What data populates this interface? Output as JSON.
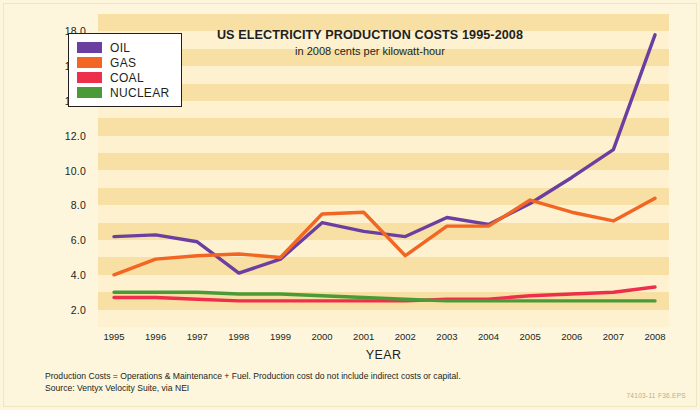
{
  "chart_data": {
    "type": "line",
    "title": "US ELECTRICITY PRODUCTION COSTS 1995-2008",
    "subtitle": "in 2008 cents per kilowatt-hour",
    "xlabel": "YEAR",
    "ylabel": "",
    "x": [
      1995,
      1996,
      1997,
      1998,
      1999,
      2000,
      2001,
      2002,
      2003,
      2004,
      2005,
      2006,
      2007,
      2008
    ],
    "categories": [
      "1995",
      "1996",
      "1997",
      "1998",
      "1999",
      "2000",
      "2001",
      "2002",
      "2003",
      "2004",
      "2005",
      "2006",
      "2007",
      "2008"
    ],
    "ylim": [
      1.0,
      19.0
    ],
    "yticks": [
      "2.0",
      "4.0",
      "6.0",
      "8.0",
      "10.0",
      "12.0",
      "14.0",
      "16.0",
      "18.0"
    ],
    "ytick_values": [
      2.0,
      4.0,
      6.0,
      8.0,
      10.0,
      12.0,
      14.0,
      16.0,
      18.0
    ],
    "grid": "horizontal-bands",
    "legend_position": "top-left",
    "series": [
      {
        "name": "OIL",
        "color": "#6B3FA0",
        "values": [
          6.2,
          6.3,
          5.9,
          4.1,
          4.9,
          7.0,
          6.5,
          6.2,
          7.3,
          6.9,
          8.1,
          9.6,
          11.2,
          17.8
        ]
      },
      {
        "name": "GAS",
        "color": "#F26522",
        "values": [
          4.0,
          4.9,
          5.1,
          5.2,
          5.0,
          7.5,
          7.6,
          5.1,
          6.8,
          6.8,
          8.3,
          7.6,
          7.1,
          8.4
        ]
      },
      {
        "name": "COAL",
        "color": "#ED2F4C",
        "values": [
          2.7,
          2.7,
          2.6,
          2.5,
          2.5,
          2.5,
          2.5,
          2.5,
          2.6,
          2.6,
          2.8,
          2.9,
          3.0,
          3.3
        ]
      },
      {
        "name": "NUCLEAR",
        "color": "#4A9B38",
        "values": [
          3.0,
          3.0,
          3.0,
          2.9,
          2.9,
          2.8,
          2.7,
          2.6,
          2.5,
          2.5,
          2.5,
          2.5,
          2.5,
          2.5
        ]
      }
    ]
  },
  "legend": {
    "items": [
      {
        "label": "OIL",
        "color": "#6B3FA0"
      },
      {
        "label": "GAS",
        "color": "#F26522"
      },
      {
        "label": "COAL",
        "color": "#ED2F4C"
      },
      {
        "label": "NUCLEAR",
        "color": "#4A9B38"
      }
    ]
  },
  "footnotes": [
    "Production Costs = Operations & Maintenance + Fuel. Production cost do not include indirect costs or capital.",
    "Source: Ventyx Velocity Suite, via NEI"
  ],
  "doc_code": "74103-11  F36.EPS",
  "colors": {
    "page_background": "#fffdf2",
    "figure_background": "#fdf6dd",
    "plot_background": "#fdf1cf",
    "band": "#f8e0a4",
    "text": "#231f20"
  }
}
